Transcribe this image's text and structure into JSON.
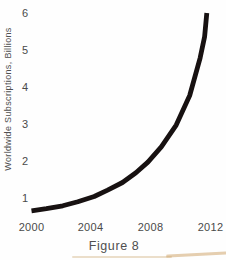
{
  "figure": {
    "caption": "Figure 8"
  },
  "chart_data": {
    "type": "line",
    "title": "",
    "xlabel": "",
    "ylabel": "Worldwide Subscriptions, Billions",
    "x_tick_labels": [
      "2000",
      "2004",
      "2008",
      "2012"
    ],
    "y_tick_labels": [
      "6",
      "5",
      "4",
      "3",
      "2",
      "1"
    ],
    "x_range": [
      2000,
      2012
    ],
    "y_range": [
      0.5,
      6
    ],
    "grid": false,
    "axis_lines": false,
    "legend": false,
    "series": [
      {
        "name": "worldwide-subscriptions",
        "x": [
          2000,
          2001,
          2002.1,
          2003.1,
          2004.2,
          2005.1,
          2006.1,
          2007.0,
          2007.8,
          2008.7,
          2009.7,
          2010.6,
          2011.3,
          2011.6,
          2011.75
        ],
        "y": [
          0.65,
          0.71,
          0.79,
          0.9,
          1.04,
          1.21,
          1.42,
          1.68,
          1.97,
          2.38,
          2.97,
          3.77,
          4.78,
          5.36,
          6.0
        ],
        "color": "#171111",
        "stroke_width_px": 4.8
      }
    ]
  },
  "colors": {
    "background": "#fefefe",
    "text": "#4c4c4c",
    "curve": "#171111"
  }
}
